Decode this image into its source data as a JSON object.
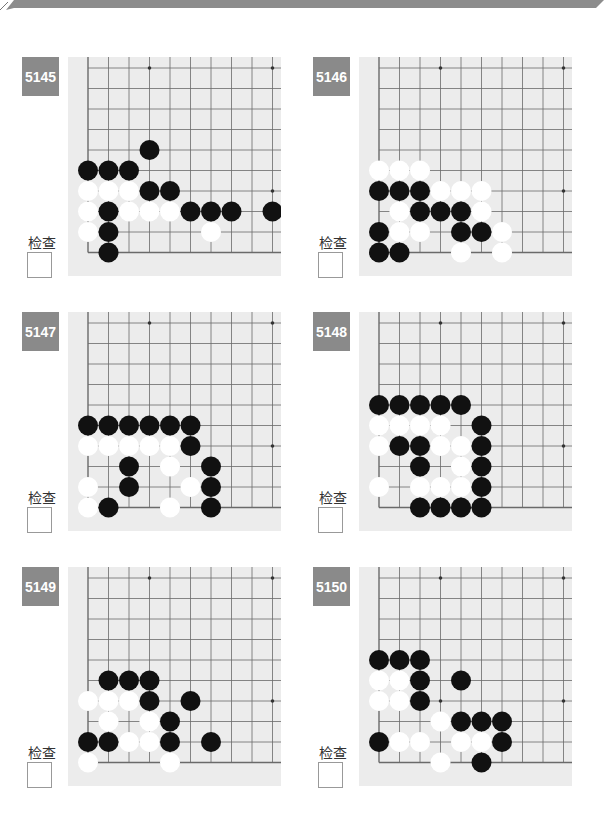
{
  "colors": {
    "label_bg": "#8a8a8a",
    "board_bg": "#ececec",
    "grid": "#6a6a6a",
    "banner": "#8c8c8c"
  },
  "check_label": "检查",
  "problems": [
    {
      "number": "5145",
      "black": [
        [
          4,
          3
        ],
        [
          5,
          0
        ],
        [
          5,
          1
        ],
        [
          5,
          2
        ],
        [
          6,
          3
        ],
        [
          6,
          4
        ],
        [
          7,
          1
        ],
        [
          7,
          5
        ],
        [
          7,
          6
        ],
        [
          7,
          7
        ],
        [
          7,
          9
        ],
        [
          8,
          1
        ],
        [
          9,
          1
        ]
      ],
      "white": [
        [
          6,
          0
        ],
        [
          6,
          1
        ],
        [
          6,
          2
        ],
        [
          7,
          0
        ],
        [
          7,
          2
        ],
        [
          7,
          3
        ],
        [
          7,
          4
        ],
        [
          8,
          0
        ],
        [
          8,
          6
        ]
      ]
    },
    {
      "number": "5146",
      "black": [
        [
          6,
          0
        ],
        [
          6,
          1
        ],
        [
          6,
          2
        ],
        [
          7,
          2
        ],
        [
          7,
          3
        ],
        [
          7,
          4
        ],
        [
          8,
          0
        ],
        [
          8,
          4
        ],
        [
          8,
          5
        ],
        [
          9,
          0
        ],
        [
          9,
          1
        ]
      ],
      "white": [
        [
          5,
          0
        ],
        [
          5,
          1
        ],
        [
          5,
          2
        ],
        [
          6,
          3
        ],
        [
          6,
          4
        ],
        [
          6,
          5
        ],
        [
          7,
          1
        ],
        [
          7,
          5
        ],
        [
          8,
          1
        ],
        [
          8,
          2
        ],
        [
          8,
          6
        ],
        [
          9,
          4
        ],
        [
          9,
          6
        ]
      ]
    },
    {
      "number": "5147",
      "black": [
        [
          5,
          0
        ],
        [
          5,
          1
        ],
        [
          5,
          2
        ],
        [
          5,
          3
        ],
        [
          5,
          4
        ],
        [
          5,
          5
        ],
        [
          6,
          5
        ],
        [
          7,
          2
        ],
        [
          7,
          6
        ],
        [
          8,
          2
        ],
        [
          8,
          6
        ],
        [
          9,
          1
        ],
        [
          9,
          6
        ]
      ],
      "white": [
        [
          6,
          0
        ],
        [
          6,
          1
        ],
        [
          6,
          2
        ],
        [
          6,
          3
        ],
        [
          6,
          4
        ],
        [
          7,
          4
        ],
        [
          8,
          0
        ],
        [
          8,
          5
        ],
        [
          9,
          0
        ],
        [
          9,
          4
        ]
      ]
    },
    {
      "number": "5148",
      "black": [
        [
          4,
          0
        ],
        [
          4,
          1
        ],
        [
          4,
          2
        ],
        [
          4,
          3
        ],
        [
          4,
          4
        ],
        [
          5,
          5
        ],
        [
          6,
          1
        ],
        [
          6,
          2
        ],
        [
          6,
          5
        ],
        [
          7,
          2
        ],
        [
          7,
          5
        ],
        [
          8,
          5
        ],
        [
          9,
          2
        ],
        [
          9,
          3
        ],
        [
          9,
          4
        ],
        [
          9,
          5
        ]
      ],
      "white": [
        [
          5,
          0
        ],
        [
          5,
          1
        ],
        [
          5,
          2
        ],
        [
          5,
          3
        ],
        [
          6,
          0
        ],
        [
          6,
          3
        ],
        [
          6,
          4
        ],
        [
          7,
          4
        ],
        [
          8,
          0
        ],
        [
          8,
          2
        ],
        [
          8,
          3
        ],
        [
          8,
          4
        ]
      ]
    },
    {
      "number": "5149",
      "black": [
        [
          5,
          1
        ],
        [
          5,
          2
        ],
        [
          5,
          3
        ],
        [
          6,
          3
        ],
        [
          6,
          5
        ],
        [
          7,
          4
        ],
        [
          8,
          0
        ],
        [
          8,
          1
        ],
        [
          8,
          4
        ],
        [
          8,
          6
        ]
      ],
      "white": [
        [
          6,
          0
        ],
        [
          6,
          1
        ],
        [
          6,
          2
        ],
        [
          7,
          1
        ],
        [
          7,
          3
        ],
        [
          8,
          2
        ],
        [
          8,
          3
        ],
        [
          9,
          0
        ],
        [
          9,
          4
        ]
      ]
    },
    {
      "number": "5150",
      "black": [
        [
          4,
          0
        ],
        [
          4,
          1
        ],
        [
          4,
          2
        ],
        [
          5,
          2
        ],
        [
          5,
          4
        ],
        [
          6,
          2
        ],
        [
          7,
          4
        ],
        [
          7,
          5
        ],
        [
          7,
          6
        ],
        [
          8,
          0
        ],
        [
          8,
          6
        ],
        [
          9,
          5
        ]
      ],
      "white": [
        [
          5,
          0
        ],
        [
          5,
          1
        ],
        [
          6,
          0
        ],
        [
          6,
          1
        ],
        [
          7,
          3
        ],
        [
          8,
          1
        ],
        [
          8,
          2
        ],
        [
          8,
          4
        ],
        [
          8,
          5
        ],
        [
          9,
          3
        ]
      ]
    }
  ]
}
